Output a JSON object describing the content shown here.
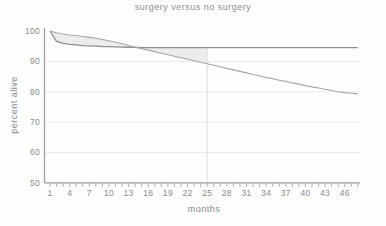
{
  "chart_data": {
    "type": "line",
    "title": "surgery versus no surgery",
    "xlabel": "months",
    "ylabel": "percent alive",
    "xlim": [
      1,
      48
    ],
    "ylim": [
      50,
      100
    ],
    "x_ticks_labeled": [
      1,
      4,
      7,
      10,
      13,
      16,
      19,
      22,
      25,
      28,
      31,
      34,
      37,
      40,
      43,
      46
    ],
    "y_ticks": [
      100,
      90,
      80,
      70,
      60,
      50
    ],
    "gridlines_y": [
      90,
      80,
      70,
      60
    ],
    "legend": "none",
    "x": [
      1,
      2,
      3,
      4,
      5,
      6,
      7,
      8,
      9,
      10,
      11,
      12,
      13,
      14,
      15,
      16,
      17,
      18,
      19,
      20,
      21,
      22,
      23,
      24,
      25,
      26,
      27,
      28,
      29,
      30,
      31,
      32,
      33,
      34,
      35,
      36,
      37,
      38,
      39,
      40,
      41,
      42,
      43,
      44,
      45,
      46,
      47,
      48
    ],
    "series": [
      {
        "name": "surgery",
        "color": "#8e8e8e",
        "values": [
          100,
          96.6,
          95.9,
          95.6,
          95.4,
          95.2,
          95.1,
          95.0,
          94.9,
          94.85,
          94.8,
          94.7,
          94.65,
          94.6,
          94.55,
          94.5,
          94.5,
          94.5,
          94.5,
          94.5,
          94.5,
          94.5,
          94.5,
          94.5,
          94.5,
          94.5,
          94.5,
          94.5,
          94.5,
          94.5,
          94.5,
          94.5,
          94.5,
          94.5,
          94.5,
          94.5,
          94.5,
          94.5,
          94.5,
          94.5,
          94.5,
          94.5,
          94.5,
          94.5,
          94.5,
          94.5,
          94.5,
          94.5
        ]
      },
      {
        "name": "no surgery",
        "color": "#a6a6a6",
        "values": [
          100,
          99.4,
          99.0,
          98.7,
          98.5,
          98.2,
          97.9,
          97.6,
          97.2,
          96.8,
          96.3,
          95.8,
          95.2,
          94.7,
          94.2,
          93.7,
          93.2,
          92.7,
          92.2,
          91.7,
          91.2,
          90.7,
          90.2,
          89.7,
          89.2,
          88.7,
          88.2,
          87.7,
          87.2,
          86.7,
          86.2,
          85.7,
          85.2,
          84.7,
          84.3,
          83.8,
          83.4,
          82.9,
          82.5,
          82.0,
          81.6,
          81.2,
          80.8,
          80.4,
          80.0,
          79.7,
          79.5,
          79.3
        ]
      }
    ],
    "shaded_region": {
      "description": "area between the two curves from month 1 to month 25",
      "from_month": 1,
      "to_month": 25,
      "color": "#ececec"
    },
    "reference_line": {
      "axis": "vertical",
      "month": 25,
      "color": "#dedede"
    },
    "colors": {
      "axis": "#9c9c9c",
      "grid": "#e9e9e9",
      "tick_text": "#8c8c8c",
      "background": "#fdfdfd"
    }
  }
}
